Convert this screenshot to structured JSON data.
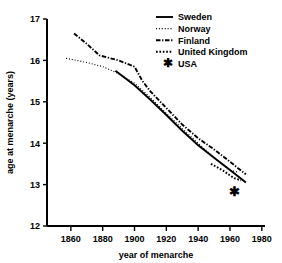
{
  "chart_data": {
    "type": "line",
    "title": "",
    "xlabel": "year of menarche",
    "ylabel": "age at menarche (years)",
    "xlim": [
      1845,
      1982
    ],
    "ylim": [
      12,
      17
    ],
    "xticks": [
      1860,
      1880,
      1900,
      1920,
      1940,
      1960,
      1980
    ],
    "xtick_labels": [
      "1860",
      "1880",
      "1900",
      "1920",
      "1940",
      "1960",
      "1980"
    ],
    "yticks": [
      12,
      13,
      14,
      15,
      16,
      17
    ],
    "ytick_labels": [
      "12",
      "13",
      "14",
      "15",
      "16",
      "17"
    ],
    "grid": false,
    "legend_position": "top-right",
    "series": [
      {
        "name": "Sweden",
        "style": "solid",
        "color": "#000000",
        "x": [
          1888,
          1900,
          1910,
          1920,
          1930,
          1940,
          1950,
          1960,
          1970
        ],
        "y": [
          15.75,
          15.4,
          15.05,
          14.68,
          14.3,
          13.95,
          13.65,
          13.35,
          13.05
        ]
      },
      {
        "name": "Norway",
        "style": "fine-dotted",
        "color": "#000000",
        "x": [
          1857,
          1870,
          1880,
          1890,
          1900,
          1910,
          1920,
          1930,
          1940,
          1950,
          1960,
          1965
        ],
        "y": [
          16.05,
          15.95,
          15.85,
          15.68,
          15.45,
          15.1,
          14.72,
          14.35,
          14.0,
          13.65,
          13.35,
          13.3
        ]
      },
      {
        "name": "Finland",
        "style": "dash-dot",
        "color": "#000000",
        "x": [
          1862,
          1870,
          1878,
          1890,
          1900,
          1905,
          1910,
          1920,
          1930,
          1940,
          1950,
          1960,
          1970
        ],
        "y": [
          16.65,
          16.4,
          16.12,
          16.0,
          15.85,
          15.5,
          15.25,
          14.85,
          14.45,
          14.12,
          13.85,
          13.55,
          13.25
        ]
      },
      {
        "name": "United Kingdom",
        "style": "coarse-dotted",
        "color": "#000000",
        "x": [
          1948,
          1952,
          1956,
          1960,
          1963,
          1967
        ],
        "y": [
          13.5,
          13.42,
          13.33,
          13.22,
          13.15,
          13.1
        ]
      },
      {
        "name": "USA",
        "style": "marker-asterisk",
        "color": "#000000",
        "x": [
          1963
        ],
        "y": [
          12.82
        ]
      }
    ],
    "legend_entries": [
      {
        "label": "Sweden",
        "style": "solid"
      },
      {
        "label": "Norway",
        "style": "fine-dotted"
      },
      {
        "label": "Finland",
        "style": "dash-dot"
      },
      {
        "label": "United Kingdom",
        "style": "coarse-dotted"
      },
      {
        "label": "USA",
        "style": "marker-asterisk"
      }
    ]
  }
}
